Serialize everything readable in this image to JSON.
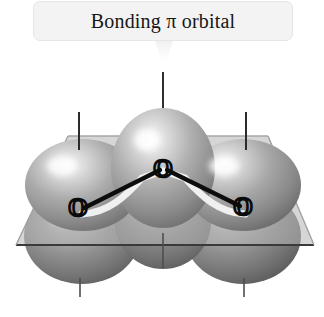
{
  "figure": {
    "title": "Bonding π orbital",
    "molecule": "O3",
    "atom_labels": [
      "O",
      "O",
      "O"
    ],
    "atom_label_left": "O",
    "atom_label_center": "O",
    "atom_label_right": "O",
    "colors": {
      "title_box_fill": "#f3f3f3",
      "title_box_border": "#e6e6e6",
      "title_text": "#171717",
      "lobe_upper_light": "#e9e9e9",
      "lobe_upper_mid": "#9d9d9d",
      "lobe_upper_dark": "#6d6d6d",
      "lobe_lower_light": "#c9c9c9",
      "lobe_lower_mid": "#8a8a8a",
      "lobe_lower_dark": "#5e5e5e",
      "plane_fill": "#b7b7b7",
      "plane_edge": "#9a9a9a",
      "plane_front_edge": "#3a3a3a",
      "bond_line": "#101010",
      "bond_highlight": "#f2f2f2",
      "leader_line": "#4a4a4a",
      "background": "#ffffff"
    },
    "leader_lines": {
      "top_center": "vertical-line-top-center",
      "upper_left": "vertical-line-upper-left",
      "upper_right": "vertical-line-upper-right",
      "lower_center": "vertical-line-lower-center",
      "bottom_left": "vertical-line-bottom-left",
      "bottom_right": "vertical-line-bottom-right"
    },
    "plane_label": "nodal-plane",
    "lobes": {
      "upper": [
        "upper-left-lobe",
        "upper-center-lobe",
        "upper-right-lobe"
      ],
      "lower": [
        "lower-left-lobe",
        "lower-center-lobe",
        "lower-right-lobe"
      ]
    }
  }
}
